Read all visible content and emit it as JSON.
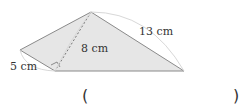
{
  "figure": {
    "shape": "quadrilateral split into two triangles",
    "labels": {
      "side_short": "5 cm",
      "height": "8 cm",
      "side_long": "13 cm"
    },
    "right_angle_marker": true,
    "fill_color": "#e6e6e6",
    "line_color": "#8a8a8a"
  },
  "answer": {
    "open_paren": "(",
    "close_paren": ")",
    "value": ""
  }
}
